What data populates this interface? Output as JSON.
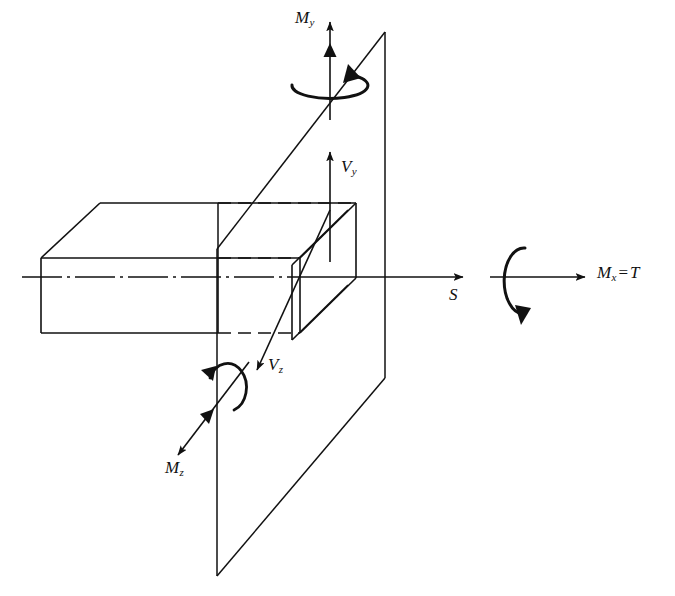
{
  "figure": {
    "type": "engineering-free-body-diagram",
    "background_color": "#ffffff",
    "line_color": "#111111"
  },
  "labels": {
    "moment_y": {
      "symbol": "M",
      "subscript": "y",
      "text": "My"
    },
    "shear_y": {
      "symbol": "V",
      "subscript": "y",
      "text": "Vy"
    },
    "shear_z": {
      "symbol": "V",
      "subscript": "z",
      "text": "Vz"
    },
    "moment_z": {
      "symbol": "M",
      "subscript": "z",
      "text": "Mz"
    },
    "section_s": {
      "symbol": "S",
      "text": "S"
    },
    "torsion": {
      "symbol": "M",
      "subscript": "x",
      "equals": "=",
      "value": "T",
      "text": "Mx = T"
    }
  },
  "components": {
    "beam": "rectangular-prism-cantilever",
    "cutting_plane": "vertical-parallelogram-section-plane",
    "cross_section_slab": "thin-slab-at-cut",
    "centerline": "dash-dot-x-axis",
    "hidden_edges": "dashed-lines",
    "torsion_curl": "circular-arrow-about-x-axis",
    "moment_y_curl": "elliptical-arrow-about-y-axis",
    "moment_z_curl": "circular-arrow-about-z-axis"
  },
  "vectors": {
    "moment_y": {
      "direction": "up",
      "arrowhead": "double",
      "axis": "y"
    },
    "shear_y": {
      "direction": "up",
      "arrowhead": "single",
      "axis": "y"
    },
    "shear_z": {
      "direction": "down-left",
      "arrowhead": "single",
      "axis": "z"
    },
    "moment_z": {
      "direction": "down-left",
      "arrowhead": "double",
      "axis": "z"
    },
    "axial_s": {
      "direction": "right",
      "arrowhead": "single",
      "axis": "x"
    },
    "torsion_x": {
      "direction": "right",
      "arrowhead": "single",
      "axis": "x"
    }
  }
}
